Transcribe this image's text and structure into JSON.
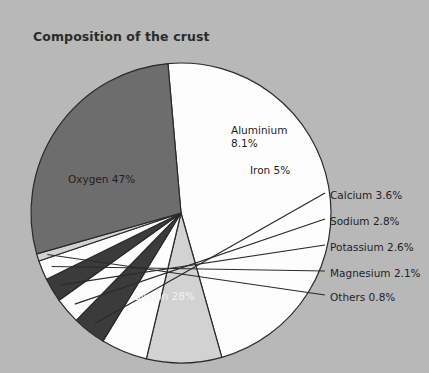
{
  "chart_data": {
    "type": "pie",
    "title": "Composition of the crust",
    "xlabel": "",
    "ylabel": "",
    "legend_position": "none",
    "grid": false,
    "unit": "%",
    "categories": [
      "Oxygen",
      "Silicon",
      "Aluminium",
      "Iron",
      "Calcium",
      "Sodium",
      "Potassium",
      "Magnesium",
      "Others"
    ],
    "values": [
      47,
      28,
      8.1,
      5,
      3.6,
      2.8,
      2.6,
      2.1,
      0.8
    ],
    "labels": [
      "Oxygen 47%",
      "Silicon 28%",
      "Aluminium 8.1%",
      "Iron 5%",
      "Calcium 3.6%",
      "Sodium 2.8%",
      "Potassium 2.6%",
      "Magnesium 2.1%",
      "Others 0.8%"
    ],
    "slice_colors": [
      "#fdfdfd",
      "#6d6d6d",
      "#d2d2d2",
      "#fdfdfd",
      "#3b3b3b",
      "#fdfdfd",
      "#3b3b3b",
      "#fdfdfd",
      "#d2d2d2"
    ],
    "label_placement": [
      "inside",
      "inside",
      "inside",
      "inside",
      "callout",
      "callout",
      "callout",
      "callout",
      "callout"
    ]
  },
  "chart": {
    "title": "Composition of the crust",
    "slices": [
      {
        "name": "Oxygen",
        "label": "Oxygen 47%",
        "value": 47,
        "color": "#fdfdfd"
      },
      {
        "name": "Aluminium",
        "label_line1": "Aluminium",
        "label_line2": "8.1%",
        "value": 8.1,
        "color": "#d2d2d2"
      },
      {
        "name": "Iron",
        "label": "Iron 5%",
        "value": 5,
        "color": "#fdfdfd"
      },
      {
        "name": "Calcium",
        "label": "Calcium 3.6%",
        "value": 3.6,
        "color": "#3b3b3b"
      },
      {
        "name": "Sodium",
        "label": "Sodium 2.8%",
        "value": 2.8,
        "color": "#fdfdfd"
      },
      {
        "name": "Potassium",
        "label": "Potassium 2.6%",
        "value": 2.6,
        "color": "#3b3b3b"
      },
      {
        "name": "Magnesium",
        "label": "Magnesium 2.1%",
        "value": 2.1,
        "color": "#fdfdfd"
      },
      {
        "name": "Others",
        "label": "Others 0.8%",
        "value": 0.8,
        "color": "#d2d2d2"
      },
      {
        "name": "Silicon",
        "label": "Silicon 28%",
        "value": 28,
        "color": "#6d6d6d"
      }
    ]
  },
  "colors": {
    "background": "#b8b8b8",
    "outline": "#2a2a2a",
    "text": "#1f1f1f",
    "text_light": "#f2f2f2"
  }
}
